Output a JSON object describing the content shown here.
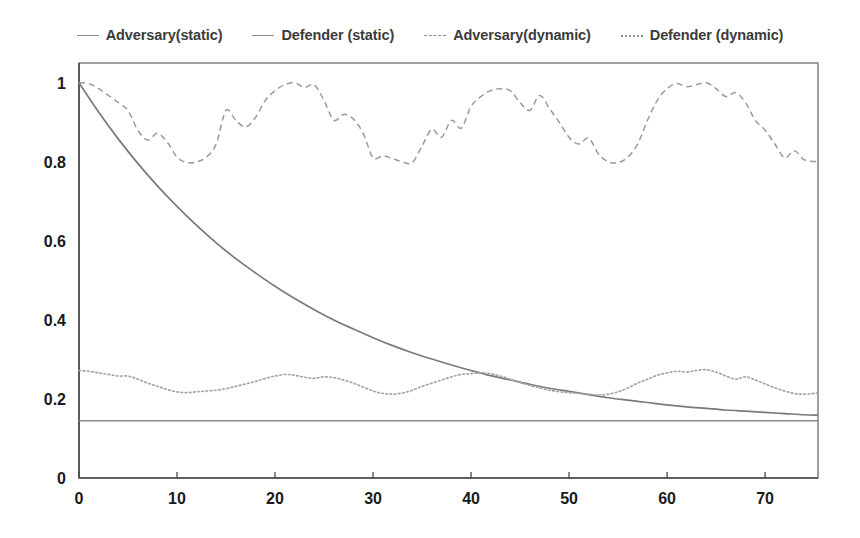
{
  "legend": {
    "position": "top-center",
    "entries": [
      {
        "label": "Adversary(static)",
        "style": "solid",
        "swatch": "legend-line-solid-icon"
      },
      {
        "label": "Defender (static)",
        "style": "solid",
        "swatch": "legend-line-solid-icon"
      },
      {
        "label": "Adversary(dynamic)",
        "style": "dashed",
        "swatch": "legend-line-dashed-icon"
      },
      {
        "label": "Defender (dynamic)",
        "style": "dotted",
        "swatch": "legend-line-dotted-icon"
      }
    ]
  },
  "chart_data": {
    "type": "line",
    "title": "",
    "xlabel": "",
    "ylabel": "",
    "xlim": [
      0,
      75.4
    ],
    "ylim": [
      0,
      1.05
    ],
    "grid": false,
    "xticks": [
      0,
      10,
      20,
      30,
      40,
      50,
      60,
      70
    ],
    "xticklabels": [
      "0",
      "10",
      "20",
      "30",
      "40",
      "50",
      "60",
      "70"
    ],
    "yticks": [
      0,
      0.2,
      0.4,
      0.6,
      0.8,
      1
    ],
    "yticklabels": [
      "0",
      "0.2",
      "0.4",
      "0.6",
      "0.8",
      "1"
    ],
    "line_color": "#8c8c8c",
    "frame_color": "#6e6e6e",
    "background": "#ffffff",
    "series": [
      {
        "name": "Adversary(static)",
        "style": "solid",
        "description": "constant horizontal line",
        "x": [
          0,
          75.4
        ],
        "values": [
          0.145,
          0.145
        ]
      },
      {
        "name": "Defender (static)",
        "style": "solid",
        "description": "exponential decay from 1 toward ~0.15",
        "x": [
          0,
          2,
          4,
          6,
          8,
          10,
          12,
          14,
          16,
          18,
          20,
          22,
          24,
          26,
          28,
          30,
          32,
          34,
          36,
          38,
          40,
          42,
          44,
          46,
          48,
          50,
          52,
          54,
          56,
          58,
          60,
          62,
          64,
          66,
          68,
          70,
          72,
          74,
          75.4
        ],
        "values": [
          1.0,
          0.926,
          0.858,
          0.796,
          0.739,
          0.687,
          0.639,
          0.595,
          0.555,
          0.519,
          0.485,
          0.454,
          0.426,
          0.4,
          0.377,
          0.355,
          0.335,
          0.317,
          0.301,
          0.286,
          0.272,
          0.259,
          0.248,
          0.237,
          0.227,
          0.219,
          0.211,
          0.203,
          0.197,
          0.191,
          0.185,
          0.18,
          0.176,
          0.172,
          0.169,
          0.166,
          0.163,
          0.16,
          0.159
        ]
      },
      {
        "name": "Adversary(dynamic)",
        "style": "dashed",
        "description": "oscillates between about 0.79 and 1.00 with roughly four cycles",
        "x": [
          0,
          1,
          2,
          3,
          4,
          5,
          6,
          7,
          8,
          9,
          10,
          11,
          12,
          13,
          14,
          15,
          16,
          17,
          18,
          19,
          20,
          21,
          22,
          23,
          24,
          25,
          26,
          27,
          28,
          29,
          30,
          31,
          32,
          33,
          34,
          35,
          36,
          37,
          38,
          39,
          40,
          41,
          42,
          43,
          44,
          45,
          46,
          47,
          48,
          49,
          50,
          51,
          52,
          53,
          54,
          55,
          56,
          57,
          58,
          59,
          60,
          61,
          62,
          63,
          64,
          65,
          66,
          67,
          68,
          69,
          70,
          71,
          72,
          73,
          74,
          75.4
        ],
        "values": [
          1.0,
          0.998,
          0.985,
          0.968,
          0.95,
          0.93,
          0.88,
          0.855,
          0.872,
          0.85,
          0.812,
          0.798,
          0.8,
          0.812,
          0.845,
          0.93,
          0.905,
          0.888,
          0.912,
          0.955,
          0.98,
          0.995,
          1.0,
          0.988,
          0.995,
          0.955,
          0.905,
          0.92,
          0.908,
          0.872,
          0.81,
          0.815,
          0.808,
          0.8,
          0.798,
          0.84,
          0.882,
          0.862,
          0.905,
          0.885,
          0.94,
          0.965,
          0.98,
          0.985,
          0.98,
          0.95,
          0.93,
          0.968,
          0.935,
          0.9,
          0.862,
          0.845,
          0.86,
          0.82,
          0.8,
          0.798,
          0.812,
          0.845,
          0.905,
          0.955,
          0.985,
          0.998,
          0.99,
          0.995,
          1.0,
          0.985,
          0.965,
          0.975,
          0.95,
          0.905,
          0.88,
          0.845,
          0.81,
          0.828,
          0.805,
          0.8
        ]
      },
      {
        "name": "Defender (dynamic)",
        "style": "dotted",
        "description": "oscillates between about 0.205 and 0.275",
        "x": [
          0,
          1,
          2,
          3,
          4,
          5,
          6,
          7,
          8,
          9,
          10,
          11,
          12,
          13,
          14,
          15,
          16,
          17,
          18,
          19,
          20,
          21,
          22,
          23,
          24,
          25,
          26,
          27,
          28,
          29,
          30,
          31,
          32,
          33,
          34,
          35,
          36,
          37,
          38,
          39,
          40,
          41,
          42,
          43,
          44,
          45,
          46,
          47,
          48,
          49,
          50,
          51,
          52,
          53,
          54,
          55,
          56,
          57,
          58,
          59,
          60,
          61,
          62,
          63,
          64,
          65,
          66,
          67,
          68,
          69,
          70,
          71,
          72,
          73,
          74,
          75.4
        ],
        "values": [
          0.272,
          0.27,
          0.266,
          0.262,
          0.258,
          0.258,
          0.25,
          0.24,
          0.232,
          0.224,
          0.218,
          0.216,
          0.218,
          0.22,
          0.222,
          0.226,
          0.232,
          0.238,
          0.244,
          0.252,
          0.258,
          0.262,
          0.26,
          0.255,
          0.252,
          0.256,
          0.254,
          0.248,
          0.24,
          0.23,
          0.22,
          0.214,
          0.212,
          0.215,
          0.222,
          0.232,
          0.24,
          0.248,
          0.256,
          0.262,
          0.264,
          0.266,
          0.264,
          0.258,
          0.25,
          0.242,
          0.234,
          0.228,
          0.222,
          0.218,
          0.216,
          0.214,
          0.212,
          0.21,
          0.212,
          0.218,
          0.228,
          0.24,
          0.25,
          0.26,
          0.266,
          0.27,
          0.268,
          0.272,
          0.274,
          0.268,
          0.258,
          0.25,
          0.256,
          0.248,
          0.238,
          0.228,
          0.22,
          0.214,
          0.212,
          0.215
        ]
      }
    ]
  }
}
